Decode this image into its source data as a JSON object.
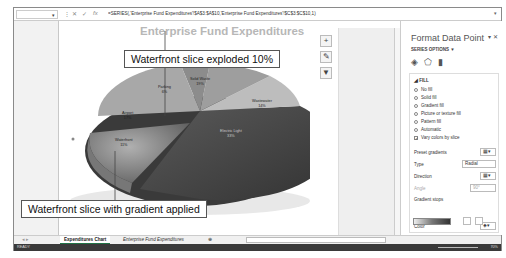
{
  "formula_bar": {
    "name_box": "",
    "formula": "=SERIES(,'Enterprise Fund Expenditures'!$A$3:$A$10,'Enterprise Fund Expenditures'!$C$3:$C$10,1)"
  },
  "chart": {
    "title": "Enterprise Fund Expenditures",
    "slices": [
      {
        "label": "Parking",
        "value": "6%"
      },
      {
        "label": "Solid Waste",
        "value": "19%"
      },
      {
        "label": "Wastewater",
        "value": "14%"
      },
      {
        "label": "Electric Light",
        "value": "33%"
      },
      {
        "label": "Waterfront",
        "value": "11%"
      },
      {
        "label": "Airport",
        "value": "17%"
      }
    ]
  },
  "callouts": {
    "top": "Waterfront slice exploded 10%",
    "bottom": "Waterfront slice with gradient applied"
  },
  "chart_tools": {
    "add": "+",
    "style": "✎",
    "filter": "▼"
  },
  "panel": {
    "title": "Format Data Point",
    "series_options": "SERIES OPTIONS ▼",
    "section": "◢ FILL",
    "fill_options": [
      "No fill",
      "Solid fill",
      "Gradient fill",
      "Picture or texture fill",
      "Pattern fill",
      "Automatic"
    ],
    "selected_fill": "Gradient fill",
    "vary_colors": "Vary colors by slice",
    "preset_gradients": "Preset gradients",
    "type_label": "Type",
    "type_value": "Radial",
    "direction_label": "Direction",
    "angle_label": "Angle",
    "angle_value": "90°",
    "gradient_stops": "Gradient stops",
    "color_label": "Color"
  },
  "tabs": [
    {
      "label": "Expenditures Chart",
      "active": true
    },
    {
      "label": "Enterprise Fund Expenditures",
      "active": false
    }
  ],
  "status": {
    "ready": "READY",
    "zoom": "70%"
  }
}
